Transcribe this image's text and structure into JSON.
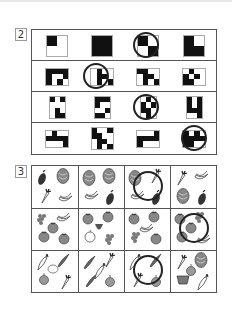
{
  "page": {
    "sections": [
      {
        "number": "2",
        "type": "pattern-grid",
        "instruction_hint": "find the odd one out in each row",
        "rows": [
          {
            "tiles": [
              {
                "size": 2,
                "cells": [
                  [
                    1,
                    0
                  ],
                  [
                    0,
                    0
                  ]
                ],
                "circled": false
              },
              {
                "size": 2,
                "cells": [
                  [
                    1,
                    1
                  ],
                  [
                    1,
                    1
                  ]
                ],
                "circled": false
              },
              {
                "size": 2,
                "cells": [
                  [
                    1,
                    0
                  ],
                  [
                    0,
                    1
                  ]
                ],
                "circled": true
              },
              {
                "size": 2,
                "cells": [
                  [
                    1,
                    0
                  ],
                  [
                    1,
                    1
                  ]
                ],
                "circled": false
              }
            ]
          },
          {
            "tiles": [
              {
                "size": 4,
                "cols": 4,
                "rows": 3,
                "cells": [
                  [
                    1,
                    1,
                    1,
                    1
                  ],
                  [
                    1,
                    0,
                    0,
                    1
                  ],
                  [
                    1,
                    0,
                    1,
                    0
                  ]
                ],
                "circled": false
              },
              {
                "size": 4,
                "cols": 4,
                "rows": 3,
                "cells": [
                  [
                    0,
                    1,
                    0,
                    0
                  ],
                  [
                    0,
                    1,
                    1,
                    0
                  ],
                  [
                    0,
                    1,
                    0,
                    1
                  ]
                ],
                "circled": true
              },
              {
                "size": 4,
                "cols": 4,
                "rows": 3,
                "cells": [
                  [
                    1,
                    1,
                    0,
                    0
                  ],
                  [
                    0,
                    1,
                    1,
                    0
                  ],
                  [
                    0,
                    1,
                    0,
                    1
                  ]
                ],
                "circled": false
              },
              {
                "size": 4,
                "cols": 4,
                "rows": 3,
                "cells": [
                  [
                    0,
                    1,
                    0,
                    0
                  ],
                  [
                    1,
                    0,
                    1,
                    0
                  ],
                  [
                    1,
                    1,
                    0,
                    0
                  ]
                ],
                "circled": false
              }
            ]
          },
          {
            "tiles": [
              {
                "size": 3,
                "cols": 3,
                "rows": 4,
                "cells": [
                  [
                    1,
                    0,
                    1
                  ],
                  [
                    0,
                    0,
                    0
                  ],
                  [
                    0,
                    1,
                    0
                  ],
                  [
                    0,
                    1,
                    1
                  ]
                ],
                "circled": false
              },
              {
                "size": 3,
                "cols": 3,
                "rows": 4,
                "cells": [
                  [
                    1,
                    1,
                    1
                  ],
                  [
                    1,
                    0,
                    0
                  ],
                  [
                    0,
                    0,
                    1
                  ],
                  [
                    1,
                    1,
                    0
                  ]
                ],
                "circled": false
              },
              {
                "size": 3,
                "cols": 3,
                "rows": 4,
                "cells": [
                  [
                    0,
                    1,
                    0
                  ],
                  [
                    1,
                    0,
                    1
                  ],
                  [
                    1,
                    1,
                    0
                  ],
                  [
                    0,
                    1,
                    0
                  ]
                ],
                "circled": true
              },
              {
                "size": 3,
                "cols": 3,
                "rows": 4,
                "cells": [
                  [
                    1,
                    0,
                    1
                  ],
                  [
                    1,
                    0,
                    1
                  ],
                  [
                    1,
                    1,
                    1
                  ],
                  [
                    0,
                    0,
                    1
                  ]
                ],
                "circled": false
              }
            ]
          },
          {
            "tiles": [
              {
                "size": 4,
                "cols": 4,
                "rows": 3,
                "cells": [
                  [
                    0,
                    1,
                    0,
                    0
                  ],
                  [
                    1,
                    1,
                    1,
                    1
                  ],
                  [
                    0,
                    0,
                    0,
                    1
                  ]
                ],
                "circled": false
              },
              {
                "size": 4,
                "cols": 4,
                "rows": 4,
                "cells": [
                  [
                    1,
                    0,
                    0,
                    1
                  ],
                  [
                    1,
                    1,
                    0,
                    0
                  ],
                  [
                    0,
                    1,
                    1,
                    0
                  ],
                  [
                    0,
                    1,
                    0,
                    1
                  ]
                ],
                "circled": false
              },
              {
                "size": 4,
                "cols": 4,
                "rows": 3,
                "cells": [
                  [
                    0,
                    0,
                    0,
                    1
                  ],
                  [
                    1,
                    1,
                    1,
                    1
                  ],
                  [
                    1,
                    0,
                    0,
                    0
                  ]
                ],
                "circled": false
              },
              {
                "size": 4,
                "cols": 4,
                "rows": 3,
                "cells": [
                  [
                    1,
                    0,
                    1,
                    0
                  ],
                  [
                    1,
                    1,
                    1,
                    1
                  ],
                  [
                    1,
                    1,
                    0,
                    0
                  ]
                ],
                "circled": true
              }
            ]
          }
        ]
      },
      {
        "number": "3",
        "type": "picture-grid",
        "instruction_hint": "find the cell with different set of items",
        "rows": [
          [
            {
              "items": [
                "eggplant",
                "cabbage",
                "carrot",
                "bananas"
              ],
              "circled": false
            },
            {
              "items": [
                "cabbage",
                "cabbage",
                "bananas",
                "eggplant"
              ],
              "circled": false
            },
            {
              "items": [
                "cabbage",
                "carrot",
                "bananas",
                "eggplant"
              ],
              "circled": true
            },
            {
              "items": [
                "carrot",
                "bananas",
                "cabbage",
                "eggplant"
              ],
              "circled": false
            }
          ],
          [
            {
              "items": [
                "grapes",
                "bananas",
                "tomato",
                "tomato",
                "tomato"
              ],
              "circled": false
            },
            {
              "items": [
                "tomato",
                "tomato",
                "apple",
                "grapes",
                "strawberry"
              ],
              "circled": false
            },
            {
              "items": [
                "tomato",
                "tomato",
                "grapes",
                "tomato",
                "bananas"
              ],
              "circled": false
            },
            {
              "items": [
                "tomato",
                "grapes",
                "tomato",
                "bananas",
                "tomato"
              ],
              "circled": true
            }
          ],
          [
            {
              "items": [
                "daikon",
                "cucumber",
                "onion",
                "carrot",
                "potato"
              ],
              "circled": false
            },
            {
              "items": [
                "cucumber",
                "carrot",
                "cucumber",
                "onion",
                "daikon"
              ],
              "circled": false
            },
            {
              "items": [
                "daikon",
                "cucumber",
                "carrot",
                "onion"
              ],
              "circled": true
            },
            {
              "items": [
                "carrot",
                "cabbage",
                "basket",
                "daikon",
                "onion"
              ],
              "circled": false
            }
          ]
        ]
      }
    ]
  }
}
